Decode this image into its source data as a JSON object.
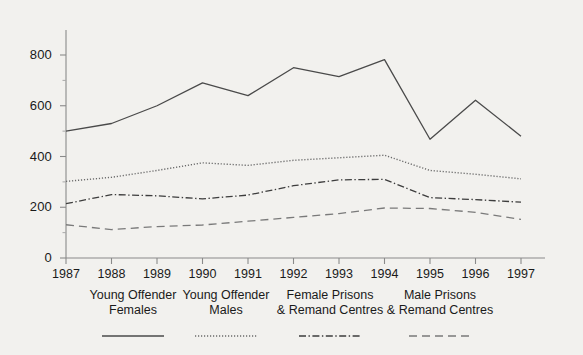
{
  "chart_data": {
    "type": "line",
    "title": "",
    "xlabel": "",
    "ylabel": "",
    "categories": [
      "1987",
      "1988",
      "1989",
      "1990",
      "1991",
      "1992",
      "1993",
      "1994",
      "1995",
      "1996",
      "1997"
    ],
    "x": [
      1987,
      1988,
      1989,
      1990,
      1991,
      1992,
      1993,
      1994,
      1995,
      1996,
      1997
    ],
    "ylim": [
      0,
      900
    ],
    "yticks": [
      0,
      200,
      400,
      600,
      800
    ],
    "xlim": [
      1987,
      1997
    ],
    "grid": false,
    "legend_position": "bottom",
    "series": [
      {
        "name": "Young Offender Females",
        "style": "solid",
        "color": "#4a4a4a",
        "values": [
          500,
          530,
          600,
          690,
          640,
          750,
          715,
          782,
          468,
          622,
          480
        ]
      },
      {
        "name": "Young Offender Males",
        "style": "dotted",
        "color": "#6b6b6b",
        "values": [
          302,
          318,
          345,
          375,
          365,
          385,
          395,
          405,
          345,
          330,
          312
        ]
      },
      {
        "name": "Female Prisons & Remand Centres",
        "style": "dashdot",
        "color": "#3d3d3d",
        "values": [
          214,
          250,
          245,
          233,
          248,
          285,
          308,
          310,
          238,
          230,
          220
        ]
      },
      {
        "name": "Male Prisons & Remand Centres",
        "style": "dashed",
        "color": "#7a7a7a",
        "values": [
          131,
          112,
          124,
          130,
          145,
          160,
          175,
          197,
          195,
          180,
          152
        ]
      }
    ]
  },
  "axis": {
    "y_tick_labels": [
      "800",
      "600",
      "400",
      "200",
      "0"
    ],
    "x_tick_labels": [
      "1987",
      "1988",
      "1989",
      "1990",
      "1991",
      "1992",
      "1993",
      "1994",
      "1995",
      "1996",
      "1997"
    ]
  },
  "legend": {
    "entries": [
      {
        "line1": "Young Offender",
        "line2": "Females",
        "style": "solid"
      },
      {
        "line1": "Young Offender",
        "line2": "Males",
        "style": "dotted"
      },
      {
        "line1": "Female Prisons",
        "line2": "& Remand Centres",
        "style": "dashdot"
      },
      {
        "line1": "Male Prisons",
        "line2": "& Remand Centres",
        "style": "dashed"
      }
    ]
  },
  "colors": {
    "background": "#f2f1ee",
    "axis": "#8a8a8a",
    "text": "#1a1a1a"
  }
}
